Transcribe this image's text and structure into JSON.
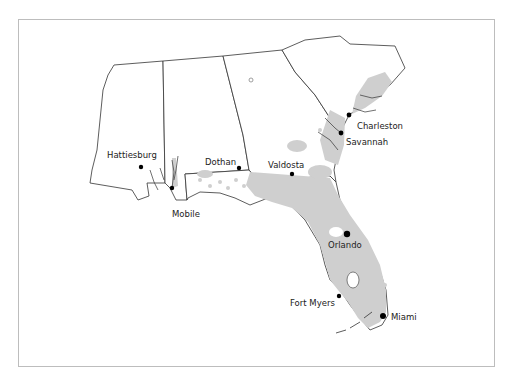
{
  "map": {
    "frame_color": "#bdbdbd",
    "range_fill": "#cfcfcf",
    "outline_color": "#333333",
    "cities": [
      {
        "name": "Hattiesburg",
        "dot": [
          141,
          167
        ],
        "r": 2.2,
        "label": [
          107,
          150
        ]
      },
      {
        "name": "Mobile",
        "dot": [
          172,
          188
        ],
        "r": 2.2,
        "label": [
          172,
          209
        ]
      },
      {
        "name": "Dothan",
        "dot": [
          239,
          168
        ],
        "r": 2.2,
        "label": [
          205,
          157
        ]
      },
      {
        "name": "Valdosta",
        "dot": [
          292,
          174
        ],
        "r": 2.2,
        "label": [
          268,
          160
        ]
      },
      {
        "name": "Charleston",
        "dot": [
          349,
          115
        ],
        "r": 2.4,
        "label": [
          357,
          121
        ]
      },
      {
        "name": "Savannah",
        "dot": [
          341,
          133
        ],
        "r": 2.4,
        "label": [
          346,
          137
        ]
      },
      {
        "name": "Orlando",
        "dot": [
          347,
          234
        ],
        "r": 3.2,
        "label": [
          328,
          240
        ]
      },
      {
        "name": "Fort Myers",
        "dot": [
          339,
          296
        ],
        "r": 2.2,
        "label": [
          290,
          298
        ]
      },
      {
        "name": "Miami",
        "dot": [
          383,
          316
        ],
        "r": 3.0,
        "label": [
          391,
          312
        ]
      }
    ],
    "isolated_marker": {
      "type": "open-circle",
      "pos": [
        251,
        80
      ]
    }
  }
}
